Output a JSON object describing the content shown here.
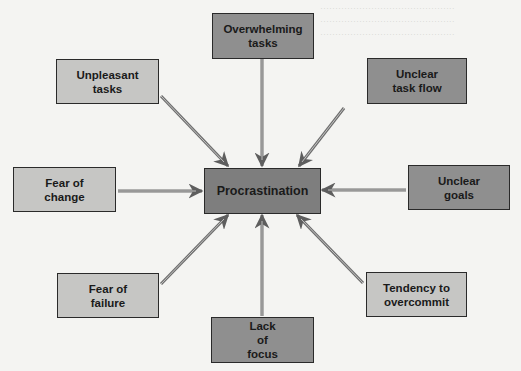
{
  "diagram": {
    "type": "hub-and-spoke cause diagram",
    "center": {
      "label": "Procrastination"
    },
    "causes": [
      {
        "id": "overwhelming",
        "label": "Overwhelming\ntasks",
        "shade": "dark"
      },
      {
        "id": "unpleasant",
        "label": "Unpleasant\ntasks",
        "shade": "light"
      },
      {
        "id": "unclear-flow",
        "label": "Unclear\ntask flow",
        "shade": "dark"
      },
      {
        "id": "fear-change",
        "label": "Fear of\nchange",
        "shade": "light"
      },
      {
        "id": "unclear-goals",
        "label": "Unclear\ngoals",
        "shade": "dark"
      },
      {
        "id": "fear-failure",
        "label": "Fear of\nfailure",
        "shade": "light"
      },
      {
        "id": "overcommit",
        "label": "Tendency to\novercommit",
        "shade": "light"
      },
      {
        "id": "lack-focus",
        "label": "Lack\nof\nfocus",
        "shade": "dark"
      }
    ],
    "colors": {
      "background": "#f4f4f2",
      "light_box": "#c6c6c4",
      "dark_box": "#8f8f8f",
      "center_box": "#7e7e7e",
      "border": "#2a2a2a",
      "arrow": "#6e6e6e"
    }
  }
}
